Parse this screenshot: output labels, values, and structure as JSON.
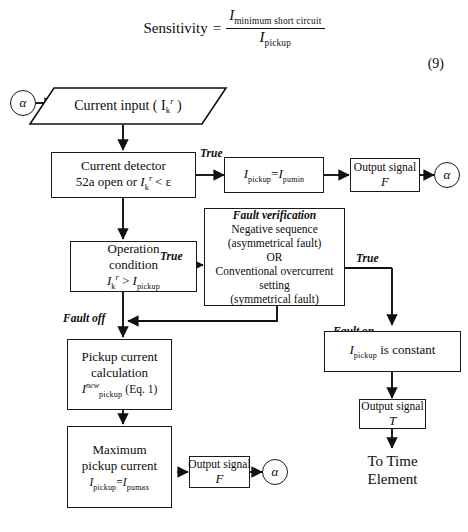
{
  "equation": {
    "lhs": "Sensitivity",
    "equals": "=",
    "numerator_symbol": "I",
    "numerator_subscript": "minimum short circuit",
    "denominator_symbol": "I",
    "denominator_subscript": "pickup",
    "number": "(9)"
  },
  "connectors": {
    "alpha_in": "α",
    "alpha_out_top": "α",
    "alpha_out_bottom": "α"
  },
  "nodes": {
    "current_input": {
      "text": "Current input ( I",
      "sub": "k",
      "sup": "r",
      "close": " )"
    },
    "current_detector": {
      "line1": "Current detector",
      "line2_a": "52a open or ",
      "line2_sym": "I",
      "line2_sub": "k",
      "line2_sup": "r",
      "line2_b": " < ε"
    },
    "pickup_assign": {
      "sym1": "I",
      "sub1": "pickup",
      "eq": "=",
      "sym2": "I",
      "sub2": "pumin"
    },
    "output_signal_f_top": {
      "line1": "Output signal",
      "line2": "F"
    },
    "operation_condition": {
      "line1": "Operation",
      "line2": "condition",
      "line3_sym1": "I",
      "line3_sub1": "k",
      "line3_sup1": "r",
      "line3_op": " > ",
      "line3_sym2": "I",
      "line3_sub2": "pickup"
    },
    "fault_verification": {
      "title": "Fault verification",
      "line1": "Negative sequence",
      "line2": "(asymmetrical fault)",
      "line3": "OR",
      "line4": "Conventional overcurrent",
      "line5": "setting",
      "line6": "(symmetrical fault)"
    },
    "pickup_calculation": {
      "line1": "Pickup current",
      "line2": "calculation",
      "line3_sym": "I",
      "line3_sub": "pickup",
      "line3_sup": "new",
      "line3_note": "(Eq. 1)"
    },
    "maximum_pickup": {
      "line1": "Maximum",
      "line2": "pickup current",
      "line3_sym1": "I",
      "line3_sub1": "pickup",
      "line3_eq": "=",
      "line3_sym2": "I",
      "line3_sub2": "pumax"
    },
    "output_signal_f_bottom": {
      "line1": "Output signal",
      "line2": "F"
    },
    "pickup_constant": {
      "sym": "I",
      "sub": "pickup",
      "text": " is constant"
    },
    "output_signal_t": {
      "line1": "Output signal",
      "line2": "T"
    },
    "to_time_element": {
      "line1": "To Time",
      "line2": "Element"
    }
  },
  "edge_labels": {
    "true_detector": "True",
    "true_operation": "True",
    "true_fault_verification": "True",
    "fault_off": "Fault off",
    "fault_on": "Fault on"
  }
}
